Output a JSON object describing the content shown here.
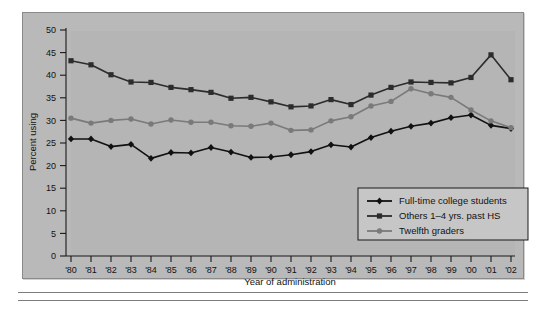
{
  "figure": {
    "panel_background": "#b5b5b5",
    "frame_color": "#8a8a8a"
  },
  "chart_data": {
    "type": "line",
    "title": "",
    "xlabel": "Year of administration",
    "ylabel": "Percent using",
    "ylim": [
      0,
      50
    ],
    "ytick_step": 5,
    "grid": false,
    "legend_position": "inside-lower-right",
    "categories": [
      "'80",
      "'81",
      "'82",
      "'83",
      "'84",
      "'85",
      "'86",
      "'87",
      "'88",
      "'89",
      "'90",
      "'91",
      "'92",
      "'93",
      "'94",
      "'95",
      "'96",
      "'97",
      "'98",
      "'99",
      "'00",
      "'01",
      "'02"
    ],
    "yticks": [
      0,
      5,
      10,
      15,
      20,
      25,
      30,
      35,
      40,
      45,
      50
    ],
    "series": [
      {
        "name": "Full-time college students",
        "color": "#111111",
        "marker": "diamond",
        "values": [
          25.9,
          25.9,
          24.2,
          24.7,
          21.6,
          22.9,
          22.8,
          24.0,
          23.0,
          21.8,
          21.9,
          22.4,
          23.1,
          24.6,
          24.1,
          26.2,
          27.6,
          28.7,
          29.4,
          30.6,
          31.2,
          28.9,
          28.2
        ]
      },
      {
        "name": "Others 1–4 yrs. past HS",
        "color": "#2c2c2c",
        "marker": "square",
        "values": [
          43.2,
          42.3,
          40.1,
          38.5,
          38.4,
          37.3,
          36.8,
          36.2,
          34.9,
          35.1,
          34.1,
          33.0,
          33.2,
          34.6,
          33.5,
          35.6,
          37.3,
          38.5,
          38.4,
          38.3,
          39.5,
          44.5,
          39.0
        ]
      },
      {
        "name": "Twelfth graders",
        "color": "#7a7a7a",
        "marker": "circle",
        "values": [
          30.5,
          29.4,
          30.0,
          30.3,
          29.2,
          30.1,
          29.6,
          29.6,
          28.8,
          28.7,
          29.4,
          27.8,
          27.9,
          29.9,
          30.8,
          33.2,
          34.2,
          37.0,
          35.9,
          35.1,
          32.3,
          29.9,
          28.4
        ]
      }
    ]
  }
}
